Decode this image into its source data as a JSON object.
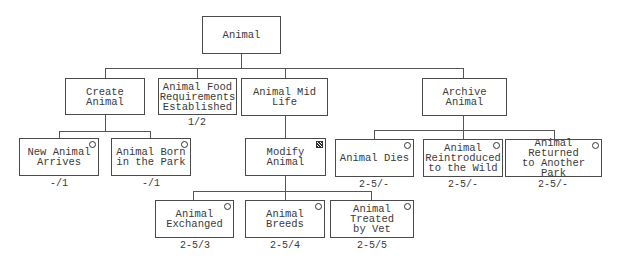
{
  "diagram": {
    "root": {
      "label": "Animal"
    },
    "level1": [
      {
        "id": "create",
        "label": "Create Animal",
        "caption": ""
      },
      {
        "id": "food",
        "label": "Animal Food\nRequirements\nEstablished",
        "caption": "1/2"
      },
      {
        "id": "midlife",
        "label": "Animal Mid Life",
        "caption": ""
      },
      {
        "id": "archive",
        "label": "Archive Animal",
        "caption": ""
      }
    ],
    "create_children": [
      {
        "label": "New Animal\nArrives",
        "caption": "-/1",
        "marker": "circle"
      },
      {
        "label": "Animal Born\nin the Park",
        "caption": "-/1",
        "marker": "circle"
      }
    ],
    "midlife_children": [
      {
        "label": "Modify Animal",
        "caption": "",
        "marker": "asterisk"
      }
    ],
    "modify_children": [
      {
        "label": "Animal\nExchanged",
        "caption": "2-5/3",
        "marker": "circle"
      },
      {
        "label": "Animal Breeds",
        "caption": "2-5/4",
        "marker": "circle"
      },
      {
        "label": "Animal Treated\nby Vet",
        "caption": "2-5/5",
        "marker": "circle"
      }
    ],
    "archive_children": [
      {
        "label": "Animal Dies",
        "caption": "2-5/-",
        "marker": "circle"
      },
      {
        "label": "Animal\nReintroduced\nto the Wild",
        "caption": "2-5/-",
        "marker": "circle"
      },
      {
        "label": "Animal Returned\nto Another\nPark",
        "caption": "2-5/-",
        "marker": "circle"
      }
    ]
  }
}
